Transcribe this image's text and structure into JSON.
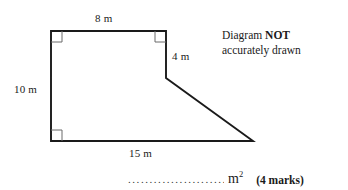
{
  "figure": {
    "name": "composite-polygon",
    "stroke_color": "#1a1a1a",
    "right_angle_mark_color": "#6b6b6b",
    "labels": {
      "top": "8 m",
      "left": "10 m",
      "right": "4 m",
      "bottom": "15 m"
    },
    "right_angle_marks": 3,
    "vertices": [
      {
        "name": "top-left",
        "x": 51,
        "y": 31
      },
      {
        "name": "top-right",
        "x": 166,
        "y": 31
      },
      {
        "name": "step-corner",
        "x": 166,
        "y": 78
      },
      {
        "name": "apex-right",
        "x": 253,
        "y": 141
      },
      {
        "name": "bottom-left",
        "x": 51,
        "y": 141
      }
    ]
  },
  "note": {
    "line1_prefix": "Diagram ",
    "line1_strong": "NOT",
    "line2": "accurately drawn"
  },
  "answer": {
    "dots": "...........................",
    "unit": "m",
    "unit_exponent": "2",
    "marks": "(4 marks)"
  }
}
